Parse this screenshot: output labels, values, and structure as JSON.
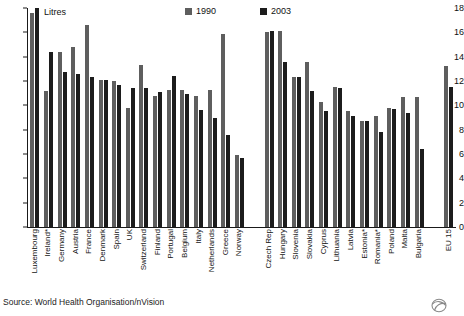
{
  "unit_label": "Litres",
  "source_note": "Source: World Health Organisation/nVision",
  "logo": {
    "name": "globe-swirl-logo"
  },
  "legend": {
    "position": "top-center",
    "entries": [
      {
        "label": "1990",
        "color": "#5e5e5e"
      },
      {
        "label": "2003",
        "color": "#1c1c1c"
      }
    ]
  },
  "yaxis": {
    "ticks": [
      "0",
      "2",
      "4",
      "6",
      "8",
      "10",
      "12",
      "14",
      "16",
      "18"
    ],
    "min": 0,
    "max": 18
  },
  "chart_data": {
    "type": "bar",
    "title": "",
    "subtitle": "",
    "xlabel": "",
    "ylabel": "Litres",
    "ylim": [
      0,
      18
    ],
    "ytick_step": 2,
    "grid": false,
    "legend_position": "top-center",
    "categories": [
      "Luxembourg",
      "Ireland*",
      "Germany",
      "Austria",
      "France",
      "Denmark",
      "Spain",
      "UK",
      "Switzerland",
      "Finland",
      "Portugal",
      "Belgium",
      "Italy",
      "Netherlands",
      "Greece",
      "Norway",
      "Czech Rep",
      "Hungary",
      "Slovenia",
      "Slovakia",
      "Cyprus",
      "Lithuania",
      "Latvia",
      "Estonia*",
      "Romania*",
      "Poland",
      "Malta",
      "Bulgaria",
      "EU 15"
    ],
    "series": [
      {
        "name": "1990",
        "color": "#5e5e5e",
        "values": [
          17.6,
          11.2,
          14.4,
          14.8,
          16.6,
          12.1,
          12.0,
          9.8,
          13.3,
          10.8,
          11.3,
          11.3,
          10.8,
          11.3,
          15.9,
          5.9,
          16.0,
          16.1,
          12.3,
          13.6,
          10.3,
          11.5,
          9.5,
          8.7,
          9.1,
          9.8,
          10.7,
          10.7,
          13.2
        ]
      },
      {
        "name": "2003",
        "color": "#1c1c1c",
        "values": [
          18.0,
          14.4,
          12.7,
          12.6,
          12.3,
          12.1,
          11.7,
          11.4,
          11.4,
          11.1,
          12.4,
          10.9,
          9.6,
          9.0,
          7.6,
          5.7,
          16.1,
          13.6,
          12.3,
          11.2,
          9.5,
          11.4,
          9.1,
          8.7,
          7.8,
          9.7,
          9.4,
          6.4,
          11.5
        ]
      }
    ],
    "group_gap_after": "Norway",
    "group_gap_after_2": "Bulgaria"
  }
}
